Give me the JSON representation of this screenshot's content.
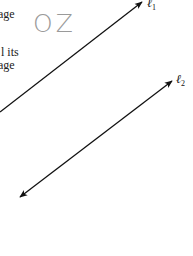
{
  "text_fragments": [
    "age",
    "l its",
    "age"
  ],
  "watermark": "OZ",
  "figure": {
    "lines": [
      {
        "label": "ℓ",
        "subscript": "1",
        "x1": 0,
        "y1": 112,
        "x2": 142,
        "y2": 2,
        "arrow_start": false,
        "arrow_end": true
      },
      {
        "label": "ℓ",
        "subscript": "2",
        "x1": 20,
        "y1": 197,
        "x2": 172,
        "y2": 81,
        "arrow_start": true,
        "arrow_end": true
      }
    ],
    "stroke_color": "#111111"
  }
}
